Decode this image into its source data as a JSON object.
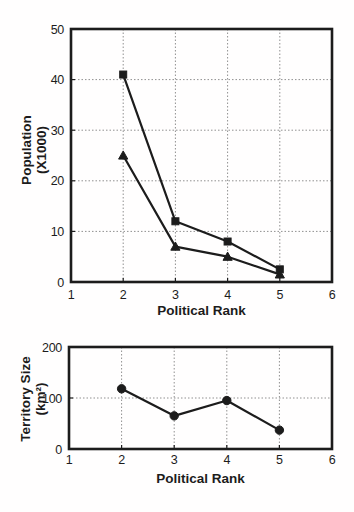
{
  "figure": {
    "background": "#fffefe",
    "ink_color": "#1c1c1c",
    "grid_color": "#909090"
  },
  "chart_data": [
    {
      "type": "line",
      "title": "",
      "xlabel": "Political Rank",
      "ylabel_lines": [
        "Population",
        "(X1000)"
      ],
      "x": [
        2,
        3,
        4,
        5
      ],
      "series": [
        {
          "name": "population-upper",
          "marker": "square",
          "values": [
            41,
            12,
            8,
            2.5
          ]
        },
        {
          "name": "population-lower",
          "marker": "triangle",
          "values": [
            25,
            7,
            5,
            1.5
          ]
        }
      ],
      "xlim": [
        1,
        6
      ],
      "ylim": [
        0,
        50
      ],
      "xticks": [
        "1",
        "2",
        "3",
        "4",
        "5",
        "6"
      ],
      "yticks": [
        "0",
        "10",
        "20",
        "30",
        "40",
        "50"
      ],
      "grid": true,
      "legend": "none"
    },
    {
      "type": "line",
      "title": "",
      "xlabel": "Political Rank",
      "ylabel_lines": [
        "Territory Size",
        "(km²)"
      ],
      "x": [
        2,
        3,
        4,
        5
      ],
      "series": [
        {
          "name": "territory-size",
          "marker": "circle",
          "values": [
            118,
            65,
            95,
            37
          ]
        }
      ],
      "xlim": [
        1,
        6
      ],
      "ylim": [
        0,
        200
      ],
      "xticks": [
        "1",
        "2",
        "3",
        "4",
        "5",
        "6"
      ],
      "yticks": [
        "0",
        "100",
        "200"
      ],
      "grid": true,
      "legend": "none"
    }
  ]
}
